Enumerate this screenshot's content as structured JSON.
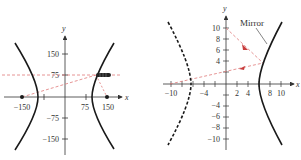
{
  "colors": {
    "axis": "#333333",
    "curve": "#1a1a1a",
    "ray": "#e07a7a",
    "arrowhead": "#c83c3c",
    "background": "#ffffff"
  },
  "left_graph": {
    "x_axis_label": "x",
    "y_axis_label": "y",
    "x_tick_labels": [
      "−150",
      "75",
      "150"
    ],
    "y_tick_labels": [
      "150",
      "75",
      "−75",
      "−150"
    ],
    "foci": [
      [
        -150,
        0
      ],
      [
        150,
        0
      ]
    ],
    "vertices": [
      [
        -96,
        0
      ],
      [
        96,
        0
      ]
    ],
    "light_source": [
      96,
      75
    ],
    "icon": "flashlight-icon"
  },
  "right_graph": {
    "x_axis_label": "x",
    "y_axis_label": "y",
    "x_tick_labels": [
      "−10",
      "−4",
      "2",
      "4",
      "8",
      "10"
    ],
    "y_tick_labels": [
      "10",
      "8",
      "6",
      "4",
      "−4",
      "−6",
      "−8",
      "−10"
    ],
    "mirror_label": "Mirror",
    "vertices": [
      [
        -6,
        0
      ],
      [
        6,
        0
      ]
    ],
    "reflection_point": [
      6.5,
      3.5
    ],
    "ray_origins": [
      [
        0,
        10
      ],
      [
        -10,
        0
      ]
    ]
  }
}
